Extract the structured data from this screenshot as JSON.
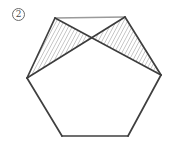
{
  "figure": {
    "label": "2",
    "background": "#ffffff",
    "colors": {
      "edge": "#3f3f3f",
      "top_edge": "#9a9a9a",
      "diagonal": "#3c3c3c",
      "hatch": "#8f8f8f",
      "badge_ring": "#6a6a6a",
      "badge_text": "#4a4a4a"
    },
    "hexagon_vertices": [
      [
        55,
        18
      ],
      [
        125,
        17
      ],
      [
        161,
        75
      ],
      [
        128,
        136
      ],
      [
        62,
        136
      ],
      [
        27,
        78
      ]
    ],
    "edges": [
      {
        "from": 0,
        "to": 1,
        "color_key": "top_edge"
      },
      {
        "from": 1,
        "to": 2,
        "color_key": "edge"
      },
      {
        "from": 2,
        "to": 3,
        "color_key": "edge"
      },
      {
        "from": 3,
        "to": 4,
        "color_key": "edge"
      },
      {
        "from": 4,
        "to": 5,
        "color_key": "edge"
      },
      {
        "from": 5,
        "to": 0,
        "color_key": "edge"
      }
    ],
    "diagonals": [
      {
        "from": [
          55,
          18
        ],
        "to": [
          161,
          75
        ]
      },
      {
        "from": [
          125,
          17
        ],
        "to": [
          27,
          78
        ]
      }
    ],
    "diagonal_intersection": [
      92,
      38
    ],
    "hatched_triangles": [
      [
        [
          27,
          78
        ],
        [
          55,
          18
        ],
        [
          92,
          38
        ]
      ],
      [
        [
          92,
          38
        ],
        [
          125,
          17
        ],
        [
          161,
          75
        ]
      ]
    ]
  }
}
